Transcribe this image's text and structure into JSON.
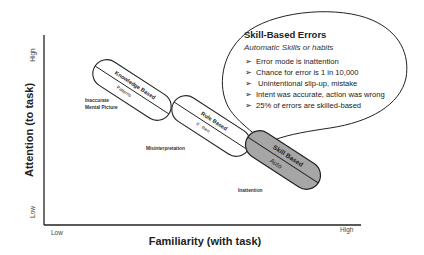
{
  "axes": {
    "y_title": "Attention (to task)",
    "x_title": "Familiarity (with task)",
    "y_high": "High",
    "y_low": "Low",
    "x_low": "Low",
    "x_high": "High"
  },
  "capsules": [
    {
      "label": "Knowledge Based",
      "sub": "Patterns",
      "note": [
        "Inaccurate",
        "Mental Picture"
      ],
      "fill": "#ffffff"
    },
    {
      "label": "Rule Based",
      "sub": "If - then",
      "note": [
        "Misinterpretation"
      ],
      "fill": "#ffffff"
    },
    {
      "label": "Skill Based",
      "sub": "Auto",
      "note": [
        "Inattention"
      ],
      "fill": "#a6a6a6"
    }
  ],
  "callout": {
    "title": "Skill-Based Errors",
    "subtitle": "Automatic Skills or habits",
    "bullet_glyph": "➢",
    "items": [
      "Error mode is inattention",
      "Chance for error is 1 in 10,000",
      " Unintentional slip-up, mistake",
      "Intent was accurate, action was wrong",
      "25% of errors are skilled-based"
    ]
  },
  "colors": {
    "stroke": "#222222",
    "skill_fill": "#a6a6a6",
    "background": "#ffffff"
  }
}
